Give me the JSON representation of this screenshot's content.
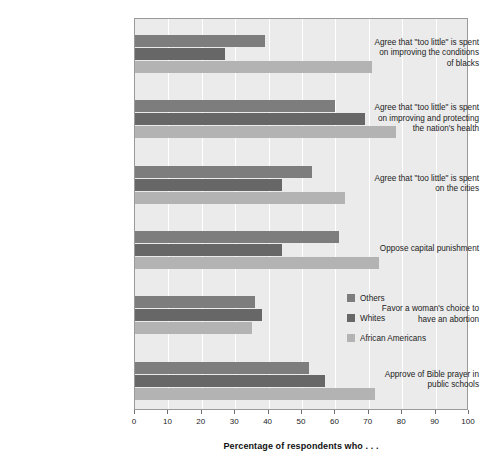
{
  "chart_data": {
    "type": "bar",
    "orientation": "horizontal",
    "title": "",
    "xlabel": "Percentage of respondents who . . .",
    "ylabel": "",
    "xlim": [
      0,
      100
    ],
    "xticks": [
      0,
      10,
      20,
      30,
      40,
      50,
      60,
      70,
      80,
      90,
      100
    ],
    "grid": true,
    "legend_position": "inside-right",
    "categories": [
      "Agree that \"too little\" is spent on improving the conditions of blacks",
      "Agree that \"too little\" is spent on improving and protecting the nation's health",
      "Agree that \"too little\" is spent on the cities",
      "Oppose capital punishment",
      "Favor a woman's choice to have an abortion",
      "Approve of Bible prayer in public schools"
    ],
    "category_lines": [
      [
        "Agree that \"too little\" is spent",
        "on improving the conditions",
        "of blacks"
      ],
      [
        "Agree that \"too little\" is spent",
        "on improving and protecting",
        "the nation's health"
      ],
      [
        "Agree that \"too little\" is spent",
        "on the cities"
      ],
      [
        "Oppose capital punishment"
      ],
      [
        "Favor a woman's choice to",
        "have an abortion"
      ],
      [
        "Approve of Bible prayer in",
        "public schools"
      ]
    ],
    "series": [
      {
        "name": "Others",
        "color": "#7d7d7d",
        "values": [
          39,
          60,
          53,
          61,
          36,
          52
        ]
      },
      {
        "name": "Whites",
        "color": "#676767",
        "values": [
          27,
          69,
          44,
          44,
          38,
          57
        ]
      },
      {
        "name": "African Americans",
        "color": "#b3b3b3",
        "values": [
          71,
          78,
          63,
          73,
          35,
          72
        ]
      }
    ]
  },
  "axis": {
    "tick_labels": [
      "0",
      "10",
      "20",
      "30",
      "40",
      "50",
      "60",
      "70",
      "80",
      "90",
      "100"
    ],
    "title": "Percentage of respondents who . . ."
  },
  "legend": {
    "items": [
      {
        "label": "Others"
      },
      {
        "label": "Whites"
      },
      {
        "label": "African Americans"
      }
    ]
  }
}
